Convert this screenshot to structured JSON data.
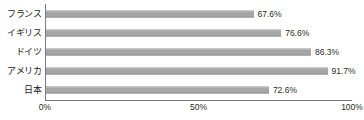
{
  "chart_data": {
    "type": "bar",
    "orientation": "horizontal",
    "title": "",
    "xlabel": "",
    "ylabel": "",
    "xlim": [
      0,
      100
    ],
    "grid": false,
    "legend": null,
    "xticks": [
      "0%",
      "50%",
      "100%"
    ],
    "xtick_values": [
      0,
      50,
      100
    ],
    "categories": [
      "フランス",
      "イギリス",
      "ドイツ",
      "アメリカ",
      "日本"
    ],
    "values": [
      67.6,
      76.6,
      86.3,
      91.7,
      72.6
    ],
    "value_labels": [
      "67.6%",
      "76.6%",
      "86.3%",
      "91.7%",
      "72.6%"
    ],
    "bar_color": "#a6a6a6",
    "axis_color": "#7a7a7a",
    "text_color": "#2b2b2b",
    "background": "#ffffff"
  }
}
